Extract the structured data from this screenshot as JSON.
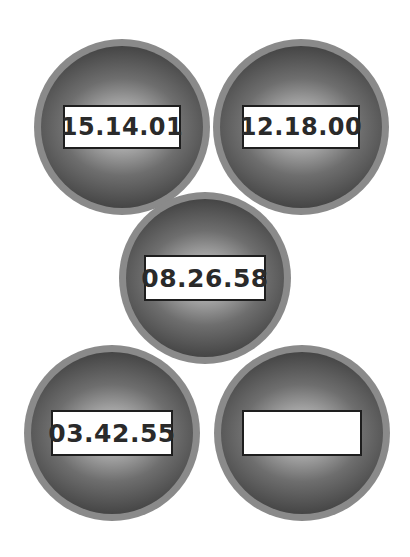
{
  "badges": [
    {
      "id": "badge-1",
      "time": "15.14.01",
      "cx": 122,
      "cy": 127,
      "r": 88,
      "box_w": 118,
      "box_h": 44,
      "font": 24
    },
    {
      "id": "badge-2",
      "time": "12.18.00",
      "cx": 301,
      "cy": 127,
      "r": 88,
      "box_w": 118,
      "box_h": 44,
      "font": 24
    },
    {
      "id": "badge-3",
      "time": "08.26.58",
      "cx": 205,
      "cy": 278,
      "r": 86,
      "box_w": 122,
      "box_h": 46,
      "font": 25
    },
    {
      "id": "badge-4",
      "time": "03.42.55",
      "cx": 112,
      "cy": 433,
      "r": 88,
      "box_w": 122,
      "box_h": 46,
      "font": 25
    },
    {
      "id": "badge-5",
      "time": "",
      "cx": 302,
      "cy": 433,
      "r": 88,
      "box_w": 120,
      "box_h": 46,
      "font": 25
    }
  ],
  "colors": {
    "background": "#ffffff",
    "ring": "#8a8a8a",
    "sphere_dark": "#454545",
    "sphere_light": "#d9d9d9",
    "box_border": "#1e1e1e",
    "text": "#2a2a2a"
  }
}
